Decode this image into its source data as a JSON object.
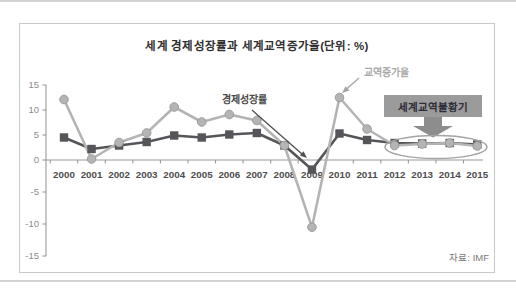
{
  "chart_data": {
    "type": "line",
    "title": "세계 경제성장률과 세계교역증가율(단위: %)",
    "categories": [
      "2000",
      "2001",
      "2002",
      "2003",
      "2004",
      "2005",
      "2006",
      "2007",
      "2008",
      "2009",
      "2010",
      "2011",
      "2012",
      "2013",
      "2014",
      "2015"
    ],
    "series": [
      {
        "key": "trade-growth",
        "name": "교역증가율",
        "marker": "circle",
        "color": "#b4b4b4",
        "values": [
          12.1,
          0.2,
          3.5,
          5.4,
          10.6,
          7.6,
          9.1,
          7.9,
          2.9,
          -10.5,
          12.5,
          6.2,
          2.9,
          3.2,
          3.4,
          2.8
        ]
      },
      {
        "key": "gdp-growth",
        "name": "경제성장률",
        "marker": "square",
        "color": "#56565a",
        "values": [
          4.5,
          2.2,
          2.9,
          3.6,
          4.9,
          4.5,
          5.1,
          5.4,
          2.9,
          -1.5,
          5.3,
          4.0,
          3.4,
          3.3,
          3.4,
          3.1
        ]
      }
    ],
    "ylim": [
      -15,
      15
    ],
    "yticks": [
      15,
      10,
      5,
      0,
      -5,
      -10,
      -15
    ],
    "grid": false,
    "legend_position": "inline-annotations",
    "annotations": {
      "recession_box": "세계교역불황기",
      "recession_years": [
        "2012",
        "2013",
        "2014",
        "2015"
      ]
    },
    "source": "자료: IMF"
  }
}
